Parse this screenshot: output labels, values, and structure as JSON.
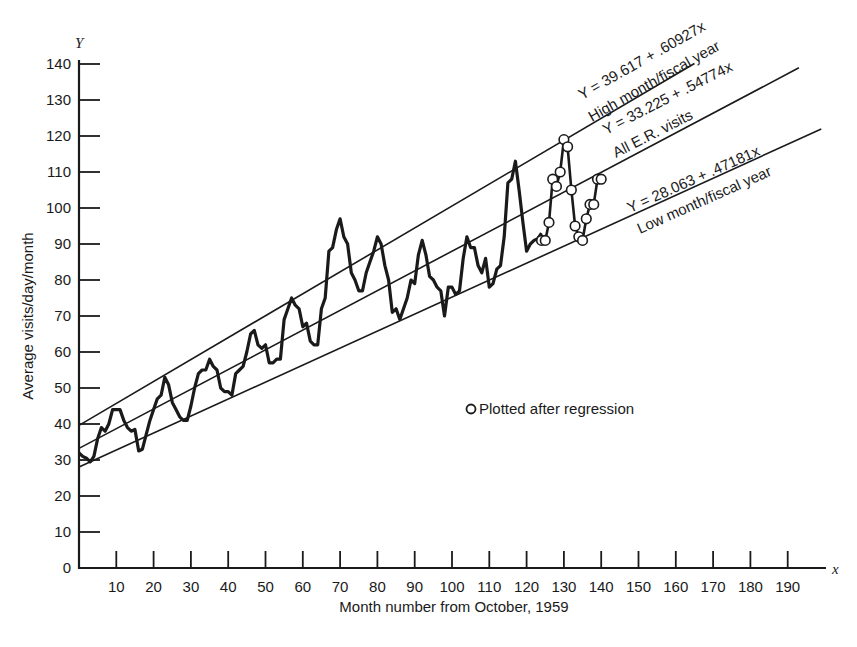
{
  "chart_data": {
    "type": "line",
    "title": "",
    "xlabel": "Month number from October, 1959",
    "ylabel": "Average visits/day/month",
    "x_axis_variable": "x",
    "y_axis_variable": "Y",
    "xlim": [
      0,
      200
    ],
    "ylim": [
      0,
      140
    ],
    "x_ticks": [
      10,
      20,
      30,
      40,
      50,
      60,
      70,
      80,
      90,
      100,
      110,
      120,
      130,
      140,
      150,
      160,
      170,
      180,
      190
    ],
    "y_ticks": [
      0,
      10,
      20,
      30,
      40,
      50,
      60,
      70,
      80,
      90,
      100,
      110,
      120,
      130,
      140
    ],
    "grid": false,
    "legend": {
      "position": "center-right",
      "entries": [
        {
          "marker": "open-circle",
          "label": "Plotted after regression"
        }
      ]
    },
    "regression_lines": [
      {
        "name": "High month/fiscal year",
        "equation": "Y = 39.617 + .60927x",
        "intercept": 39.617,
        "slope": 0.60927,
        "x_range": [
          0,
          165
        ]
      },
      {
        "name": "All E.R. visits",
        "equation": "Y = 33.225 + .54774x",
        "intercept": 33.225,
        "slope": 0.54774,
        "x_range": [
          0,
          193
        ]
      },
      {
        "name": "Low month/fiscal year",
        "equation": "Y = 28.063 + .47181x",
        "intercept": 28.063,
        "slope": 0.47181,
        "x_range": [
          0,
          199
        ]
      }
    ],
    "series": [
      {
        "name": "Monthly average visits/day",
        "style": "thick-line",
        "x": [
          0,
          1,
          2,
          3,
          4,
          5,
          6,
          7,
          8,
          9,
          10,
          11,
          12,
          13,
          14,
          15,
          16,
          17,
          18,
          19,
          20,
          21,
          22,
          23,
          24,
          25,
          26,
          27,
          28,
          29,
          30,
          31,
          32,
          33,
          34,
          35,
          36,
          37,
          38,
          39,
          40,
          41,
          42,
          43,
          44,
          45,
          46,
          47,
          48,
          49,
          50,
          51,
          52,
          53,
          54,
          55,
          56,
          57,
          58,
          59,
          60,
          61,
          62,
          63,
          64,
          65,
          66,
          67,
          68,
          69,
          70,
          71,
          72,
          73,
          74,
          75,
          76,
          77,
          78,
          79,
          80,
          81,
          82,
          83,
          84,
          85,
          86,
          87,
          88,
          89,
          90,
          91,
          92,
          93,
          94,
          95,
          96,
          97,
          98,
          99,
          100,
          101,
          102,
          103,
          104,
          105,
          106,
          107,
          108,
          109,
          110,
          111,
          112,
          113,
          114,
          115,
          116,
          117,
          118,
          119,
          120,
          121,
          122,
          123,
          124
        ],
        "values": [
          32,
          31,
          30.5,
          29.5,
          31,
          36,
          39,
          38,
          40,
          44,
          44,
          44,
          41,
          39,
          38,
          38.5,
          32.5,
          33,
          37,
          41,
          44,
          47,
          48,
          53,
          51,
          46,
          44,
          42,
          41,
          41,
          45,
          50,
          54,
          55,
          55,
          58,
          56,
          55,
          50,
          49,
          49,
          48,
          54,
          55,
          56,
          60,
          65,
          66,
          62,
          61,
          62,
          57,
          57,
          58,
          58,
          69,
          72,
          75,
          73,
          72,
          67,
          68,
          63,
          62,
          62,
          72,
          75,
          88,
          89,
          94,
          97,
          92,
          90,
          82,
          80,
          77,
          77,
          82,
          85,
          88,
          92,
          90,
          84,
          80,
          71,
          72,
          69,
          72,
          75,
          80,
          79,
          87,
          91,
          87,
          81,
          80,
          78,
          77,
          70,
          78,
          78,
          76,
          77,
          86,
          92,
          89,
          89,
          84,
          82,
          86,
          78,
          79,
          83,
          84,
          92,
          107,
          108,
          113,
          105,
          96,
          88,
          90,
          91,
          91.5,
          93
        ]
      },
      {
        "name": "Plotted after regression",
        "style": "line-with-open-circles",
        "x": [
          124,
          125,
          126,
          127,
          128,
          129,
          130,
          131,
          132,
          133,
          134,
          135,
          136,
          137,
          138,
          139,
          140
        ],
        "values": [
          91,
          91,
          96,
          108,
          106,
          110,
          119,
          117,
          105,
          95,
          92,
          91,
          97,
          101,
          101,
          108,
          108
        ]
      }
    ]
  },
  "axes": {
    "y_variable": "Y",
    "x_variable": "x",
    "y_tick_labels": [
      "0",
      "10",
      "20",
      "30",
      "40",
      "50",
      "60",
      "70",
      "80",
      "90",
      "100",
      "110",
      "120",
      "130",
      "140"
    ],
    "x_tick_labels": [
      "10",
      "20",
      "30",
      "40",
      "50",
      "60",
      "70",
      "80",
      "90",
      "100",
      "110",
      "120",
      "130",
      "140",
      "150",
      "160",
      "170",
      "180",
      "190"
    ],
    "x_title": "Month number from October, 1959",
    "y_title": "Average visits/day/month"
  },
  "annotations": {
    "high_equation": "Y = 39.617 + .60927x",
    "high_label": "High month/fiscal year",
    "all_equation": "Y = 33.225 + .54774x",
    "all_label": "All E.R. visits",
    "low_equation": "Y = 28.063 + .47181x",
    "low_label": "Low month/fiscal year"
  },
  "legend": {
    "label": "Plotted after regression"
  },
  "colors": {
    "ink": "#1a1a1a",
    "background": "#ffffff"
  }
}
